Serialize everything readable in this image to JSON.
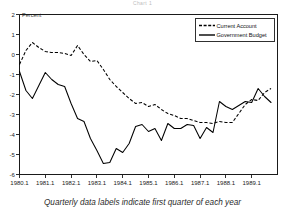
{
  "title": "Chart 1",
  "caption": "Quarterly data labels indicate first quarter of each year",
  "axis": {
    "ylabel": "Percent"
  },
  "legend": {
    "items": [
      {
        "label": "Current Account",
        "style": "dashed"
      },
      {
        "label": "Government Budget",
        "style": "solid"
      }
    ]
  },
  "chart_data": {
    "type": "line",
    "title": "Chart 1",
    "subtitle": "",
    "xlabel": "",
    "ylabel": "Percent",
    "ylim": [
      -6,
      2
    ],
    "xlim": [
      1980.0,
      1990.0
    ],
    "grid": false,
    "legend_position": "top-right",
    "annotation": "Quarterly data labels indicate first quarter of each year",
    "yticks": [
      2,
      1,
      0,
      -1,
      -2,
      -3,
      -4,
      -5,
      -6
    ],
    "ytick_labels": [
      "2",
      "1",
      "0",
      "-1",
      "-2",
      "-3",
      "-4",
      "-5",
      "-6"
    ],
    "xticks": [
      1980.0,
      1981.0,
      1982.0,
      1983.0,
      1984.0,
      1985.0,
      1986.0,
      1987.0,
      1988.0,
      1989.0
    ],
    "xtick_labels": [
      "1980.1",
      "1981.1",
      "1982.1",
      "1983.1",
      "1984.1",
      "1985.1",
      "1986.1",
      "1987.1",
      "1988.1",
      "1989.1"
    ],
    "x": [
      1980.0,
      1980.25,
      1980.5,
      1980.75,
      1981.0,
      1981.25,
      1981.5,
      1981.75,
      1982.0,
      1982.25,
      1982.5,
      1982.75,
      1983.0,
      1983.25,
      1983.5,
      1983.75,
      1984.0,
      1984.25,
      1984.5,
      1984.75,
      1985.0,
      1985.25,
      1985.5,
      1985.75,
      1986.0,
      1986.25,
      1986.5,
      1986.75,
      1987.0,
      1987.25,
      1987.5,
      1987.75,
      1988.0,
      1988.25,
      1988.5,
      1988.75,
      1989.0,
      1989.25,
      1989.5,
      1989.75
    ],
    "series": [
      {
        "name": "Current Account",
        "style": "dashed",
        "values": [
          -0.5,
          0.2,
          0.6,
          0.35,
          0.15,
          0.1,
          0.1,
          0.05,
          -0.05,
          0.45,
          0.0,
          -0.35,
          -0.3,
          -0.75,
          -1.25,
          -1.6,
          -1.9,
          -2.2,
          -2.45,
          -2.4,
          -2.6,
          -2.5,
          -2.75,
          -2.95,
          -3.05,
          -3.2,
          -3.2,
          -3.3,
          -3.4,
          -3.4,
          -3.45,
          -3.35,
          -3.4,
          -3.4,
          -2.95,
          -2.5,
          -2.25,
          -2.3,
          -1.9,
          -1.7
        ]
      },
      {
        "name": "Government Budget",
        "style": "solid",
        "values": [
          -0.85,
          -1.8,
          -2.2,
          -1.55,
          -0.9,
          -1.25,
          -1.5,
          -1.6,
          -2.45,
          -3.2,
          -3.35,
          -4.2,
          -4.8,
          -5.45,
          -5.4,
          -4.7,
          -4.9,
          -4.45,
          -3.6,
          -3.5,
          -3.85,
          -3.7,
          -4.3,
          -3.45,
          -3.7,
          -3.7,
          -3.5,
          -3.55,
          -4.2,
          -3.65,
          -3.9,
          -2.35,
          -2.6,
          -2.75,
          -2.55,
          -2.35,
          -2.4,
          -1.7,
          -2.1,
          -2.4
        ]
      }
    ]
  }
}
